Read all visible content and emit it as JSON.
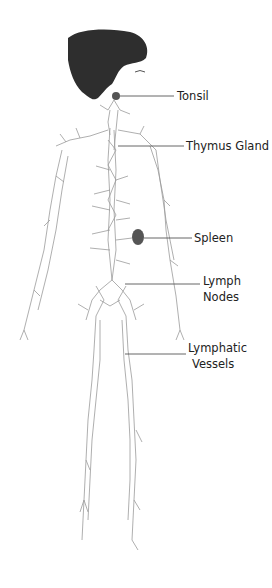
{
  "figure": {
    "colors": {
      "organ_fill": "#2e2e2e",
      "vessel_stroke": "#9a9a9a",
      "leader_line": "#555555",
      "label_text": "#222222"
    }
  },
  "labels": [
    {
      "id": "tonsil",
      "text": "Tonsil"
    },
    {
      "id": "thymus",
      "text": "Thymus Gland"
    },
    {
      "id": "spleen",
      "text": "Spleen"
    },
    {
      "id": "lymph_nodes",
      "line1": "Lymph",
      "line2": "Nodes"
    },
    {
      "id": "lymphatic_vessels",
      "line1": "Lymphatic",
      "line2": "Vessels"
    }
  ]
}
